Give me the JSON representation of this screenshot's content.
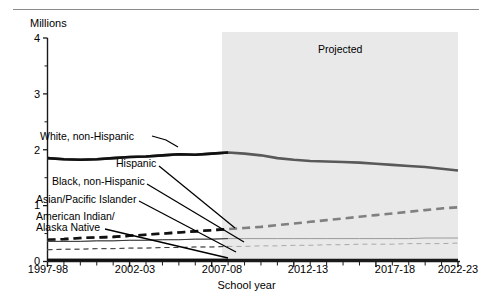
{
  "figure": {
    "title_partial": "",
    "projected_label": "Projected",
    "y_axis_unit": "Millions",
    "x_axis_title": "School year"
  },
  "chart_data": {
    "type": "line",
    "title": "",
    "xlabel": "School year",
    "ylabel": "Millions",
    "ylim": [
      0,
      4
    ],
    "yticks": [
      0,
      1,
      2,
      3,
      4
    ],
    "ytick_labels": [
      "0",
      "1",
      "2",
      "3",
      "4"
    ],
    "x": [
      "1997-98",
      "1998-99",
      "1999-2000",
      "2000-01",
      "2001-02",
      "2002-03",
      "2003-04",
      "2004-05",
      "2005-06",
      "2006-07",
      "2007-08",
      "2008-09",
      "2009-10",
      "2010-11",
      "2011-12",
      "2012-13",
      "2013-14",
      "2014-15",
      "2015-16",
      "2016-17",
      "2017-18",
      "2018-19",
      "2019-20",
      "2020-21",
      "2021-22",
      "2022-23"
    ],
    "xtick_labels": [
      "1997-98",
      "2002-03",
      "2007-08",
      "2012-13",
      "2017-18",
      "2022-23"
    ],
    "xtick_positions": [
      0,
      5,
      10,
      15,
      20,
      25
    ],
    "grid": false,
    "legend_position": "inline-annotations",
    "projection": {
      "label": "Projected",
      "starts_at": "2008-09",
      "shaded": true,
      "shade_color": "#e8e8e8"
    },
    "series": [
      {
        "name": "White, non-Hispanic",
        "style": "solid-thick",
        "color": "#595959",
        "values": [
          1.85,
          1.83,
          1.82,
          1.83,
          1.85,
          1.87,
          1.88,
          1.9,
          1.92,
          1.91,
          1.93,
          1.95,
          1.93,
          1.9,
          1.85,
          1.82,
          1.8,
          1.79,
          1.78,
          1.77,
          1.75,
          1.73,
          1.71,
          1.69,
          1.66,
          1.63
        ]
      },
      {
        "name": "Hispanic",
        "style": "dashed-thick",
        "color": "#808080",
        "values": [
          0.39,
          0.4,
          0.42,
          0.43,
          0.44,
          0.46,
          0.48,
          0.5,
          0.52,
          0.54,
          0.56,
          0.58,
          0.6,
          0.62,
          0.65,
          0.68,
          0.71,
          0.74,
          0.77,
          0.8,
          0.83,
          0.86,
          0.89,
          0.92,
          0.95,
          0.97
        ]
      },
      {
        "name": "Black, non-Hispanic",
        "style": "solid-thin",
        "color": "#9a9a9a",
        "values": [
          0.36,
          0.36,
          0.36,
          0.37,
          0.37,
          0.38,
          0.38,
          0.39,
          0.39,
          0.4,
          0.4,
          0.41,
          0.41,
          0.41,
          0.41,
          0.41,
          0.41,
          0.41,
          0.41,
          0.41,
          0.41,
          0.41,
          0.41,
          0.42,
          0.42,
          0.42
        ]
      },
      {
        "name": "Asian/Pacific Islander",
        "style": "dashed-thin",
        "color": "#a8a8a8",
        "values": [
          0.21,
          0.22,
          0.22,
          0.23,
          0.23,
          0.24,
          0.24,
          0.25,
          0.25,
          0.26,
          0.26,
          0.27,
          0.27,
          0.28,
          0.28,
          0.29,
          0.29,
          0.3,
          0.3,
          0.31,
          0.31,
          0.31,
          0.32,
          0.32,
          0.32,
          0.33
        ]
      },
      {
        "name": "American Indian/Alaska Native",
        "style": "solid-thick-dark",
        "color": "#1a1a1a",
        "values": [
          0.03,
          0.03,
          0.03,
          0.03,
          0.03,
          0.03,
          0.03,
          0.03,
          0.03,
          0.03,
          0.03,
          0.03,
          0.03,
          0.03,
          0.03,
          0.03,
          0.03,
          0.03,
          0.03,
          0.03,
          0.03,
          0.03,
          0.03,
          0.03,
          0.03,
          0.03
        ]
      }
    ],
    "annotations": [
      {
        "text": "White, non-Hispanic",
        "x": 40,
        "y": 136
      },
      {
        "text": "Hispanic",
        "x": 116,
        "y": 163
      },
      {
        "text": "Black, non-Hispanic",
        "x": 52,
        "y": 181
      },
      {
        "text": "Asian/Pacific Islander",
        "x": 36,
        "y": 199
      },
      {
        "text": "American Indian/",
        "x": 36,
        "y": 216
      },
      {
        "text": "Alaska Native",
        "x": 36,
        "y": 227
      }
    ]
  }
}
